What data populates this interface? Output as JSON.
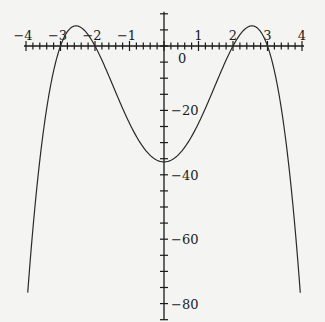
{
  "chart_data": {
    "type": "line",
    "title": "",
    "xlabel": "",
    "ylabel": "",
    "function": "y = -(x^2 - 4)(x^2 - 9)",
    "xlim": [
      -4,
      4
    ],
    "ylim": [
      -85,
      10
    ],
    "x_ticks": [
      -4,
      -3,
      -2,
      -1,
      0,
      1,
      2,
      3,
      4
    ],
    "x_tick_labels": [
      "−4",
      "−3",
      "−2",
      "−1",
      "",
      "1",
      "2",
      "3",
      "4"
    ],
    "x_minor_step": 0.2,
    "y_ticks": [
      0,
      -20,
      -40,
      -60,
      -80
    ],
    "y_tick_labels": [
      "0",
      "−20",
      "−40",
      "−60",
      "−80"
    ],
    "y_minor_step": 5,
    "grid": false,
    "legend": null,
    "series": [
      {
        "name": "f(x)",
        "x": [
          -3.95,
          -3.5,
          -3,
          -2.5,
          -2,
          -1.5,
          -1,
          -0.5,
          0,
          0.5,
          1,
          1.5,
          2,
          2.5,
          3,
          3.5,
          3.95
        ],
        "y": [
          -76.6,
          -25.3,
          0,
          6.25,
          0,
          -15.2,
          -24,
          -30.9,
          -36,
          -30.9,
          -24,
          -15.2,
          0,
          6.25,
          0,
          -25.3,
          -76.6
        ]
      }
    ],
    "key_points": {
      "roots": [
        -3,
        -2,
        2,
        3
      ],
      "local_max": [
        [
          -2.55,
          6.25
        ],
        [
          2.55,
          6.25
        ]
      ],
      "local_min": [
        0,
        -36
      ]
    }
  },
  "layout": {
    "origin_px": [
      164,
      46
    ],
    "px_per_x": 34.5,
    "px_per_y": 3.22,
    "curve_color": "#2a2a2a",
    "axis_color": "#1a1a1a"
  }
}
